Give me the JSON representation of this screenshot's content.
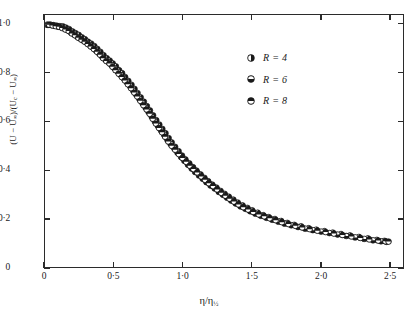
{
  "chart_data": {
    "type": "scatter",
    "title": "",
    "xlabel": "η/η½",
    "ylabel": "(U − U∞)/(Uᴄ − U∞)",
    "xlim": [
      0,
      2.6
    ],
    "ylim": [
      0,
      1.04
    ],
    "grid": false,
    "xticks": [
      0,
      0.5,
      1.0,
      1.5,
      2.0,
      2.5
    ],
    "xticklabels": [
      "0",
      "0·5",
      "1·0",
      "1·5",
      "2·0",
      "2·5"
    ],
    "yticks": [
      0,
      0.2,
      0.4,
      0.6,
      0.8,
      1.0
    ],
    "yticklabels": [
      "0",
      "0·2",
      "0·4",
      "0·6",
      "0·8",
      "1·0"
    ],
    "legend_position": "upper right",
    "marker_color": "#1a1a1a",
    "series": [
      {
        "name": "R = 4",
        "label": "R = 4",
        "marker": "circle-half-left",
        "points": [
          [
            0.015,
            1.0
          ],
          [
            0.04,
            1.0
          ],
          [
            0.062,
            0.998
          ],
          [
            0.085,
            0.996
          ],
          [
            0.108,
            0.994
          ],
          [
            0.13,
            0.993
          ],
          [
            0.152,
            0.988
          ],
          [
            0.175,
            0.982
          ],
          [
            0.2,
            0.972
          ],
          [
            0.222,
            0.965
          ],
          [
            0.245,
            0.958
          ],
          [
            0.268,
            0.948
          ],
          [
            0.29,
            0.94
          ],
          [
            0.312,
            0.93
          ],
          [
            0.335,
            0.922
          ],
          [
            0.358,
            0.912
          ],
          [
            0.38,
            0.9
          ],
          [
            0.402,
            0.888
          ],
          [
            0.425,
            0.874
          ],
          [
            0.448,
            0.862
          ],
          [
            0.47,
            0.852
          ],
          [
            0.492,
            0.84
          ],
          [
            0.515,
            0.828
          ],
          [
            0.538,
            0.812
          ],
          [
            0.56,
            0.8
          ],
          [
            0.582,
            0.784
          ],
          [
            0.605,
            0.768
          ],
          [
            0.628,
            0.752
          ],
          [
            0.65,
            0.735
          ],
          [
            0.672,
            0.718
          ],
          [
            0.695,
            0.7
          ],
          [
            0.718,
            0.682
          ],
          [
            0.74,
            0.664
          ],
          [
            0.762,
            0.646
          ],
          [
            0.785,
            0.626
          ],
          [
            0.808,
            0.606
          ],
          [
            0.83,
            0.588
          ],
          [
            0.852,
            0.57
          ],
          [
            0.875,
            0.552
          ],
          [
            0.898,
            0.532
          ],
          [
            0.92,
            0.514
          ],
          [
            0.945,
            0.496
          ],
          [
            0.97,
            0.478
          ],
          [
            0.995,
            0.46
          ],
          [
            1.02,
            0.444
          ],
          [
            1.048,
            0.428
          ],
          [
            1.075,
            0.412
          ],
          [
            1.1,
            0.398
          ],
          [
            1.13,
            0.382
          ],
          [
            1.158,
            0.368
          ],
          [
            1.185,
            0.354
          ],
          [
            1.215,
            0.34
          ],
          [
            1.245,
            0.328
          ],
          [
            1.275,
            0.314
          ],
          [
            1.305,
            0.302
          ],
          [
            1.335,
            0.29
          ],
          [
            1.368,
            0.278
          ],
          [
            1.4,
            0.266
          ],
          [
            1.435,
            0.254
          ],
          [
            1.47,
            0.244
          ],
          [
            1.505,
            0.234
          ],
          [
            1.545,
            0.224
          ],
          [
            1.585,
            0.214
          ],
          [
            1.625,
            0.206
          ],
          [
            1.67,
            0.198
          ],
          [
            1.715,
            0.19
          ],
          [
            1.76,
            0.182
          ],
          [
            1.81,
            0.174
          ],
          [
            1.86,
            0.168
          ],
          [
            1.915,
            0.16
          ],
          [
            1.97,
            0.154
          ],
          [
            2.03,
            0.148
          ],
          [
            2.09,
            0.142
          ],
          [
            2.15,
            0.136
          ],
          [
            2.215,
            0.13
          ],
          [
            2.28,
            0.124
          ],
          [
            2.345,
            0.118
          ],
          [
            2.41,
            0.112
          ],
          [
            2.465,
            0.108
          ]
        ]
      },
      {
        "name": "R = 6",
        "label": "R = 6",
        "marker": "circle-half-top",
        "points": [
          [
            0.022,
            0.999
          ],
          [
            0.048,
            0.998
          ],
          [
            0.072,
            0.995
          ],
          [
            0.095,
            0.992
          ],
          [
            0.118,
            0.99
          ],
          [
            0.142,
            0.984
          ],
          [
            0.165,
            0.978
          ],
          [
            0.188,
            0.968
          ],
          [
            0.212,
            0.96
          ],
          [
            0.235,
            0.95
          ],
          [
            0.258,
            0.942
          ],
          [
            0.28,
            0.934
          ],
          [
            0.302,
            0.926
          ],
          [
            0.325,
            0.916
          ],
          [
            0.348,
            0.906
          ],
          [
            0.37,
            0.894
          ],
          [
            0.392,
            0.882
          ],
          [
            0.415,
            0.868
          ],
          [
            0.438,
            0.856
          ],
          [
            0.46,
            0.846
          ],
          [
            0.482,
            0.834
          ],
          [
            0.505,
            0.82
          ],
          [
            0.528,
            0.806
          ],
          [
            0.55,
            0.792
          ],
          [
            0.572,
            0.778
          ],
          [
            0.595,
            0.762
          ],
          [
            0.618,
            0.746
          ],
          [
            0.64,
            0.728
          ],
          [
            0.662,
            0.712
          ],
          [
            0.685,
            0.694
          ],
          [
            0.708,
            0.676
          ],
          [
            0.73,
            0.658
          ],
          [
            0.752,
            0.64
          ],
          [
            0.775,
            0.62
          ],
          [
            0.798,
            0.6
          ],
          [
            0.82,
            0.582
          ],
          [
            0.842,
            0.564
          ],
          [
            0.865,
            0.546
          ],
          [
            0.888,
            0.526
          ],
          [
            0.912,
            0.508
          ],
          [
            0.938,
            0.49
          ],
          [
            0.962,
            0.472
          ],
          [
            0.988,
            0.454
          ],
          [
            1.012,
            0.438
          ],
          [
            1.038,
            0.422
          ],
          [
            1.065,
            0.406
          ],
          [
            1.09,
            0.392
          ],
          [
            1.118,
            0.378
          ],
          [
            1.145,
            0.364
          ],
          [
            1.172,
            0.35
          ],
          [
            1.202,
            0.336
          ],
          [
            1.232,
            0.324
          ],
          [
            1.262,
            0.31
          ],
          [
            1.292,
            0.298
          ],
          [
            1.322,
            0.286
          ],
          [
            1.352,
            0.274
          ],
          [
            1.385,
            0.262
          ],
          [
            1.42,
            0.25
          ],
          [
            1.455,
            0.24
          ],
          [
            1.49,
            0.23
          ],
          [
            1.528,
            0.22
          ],
          [
            1.568,
            0.211
          ],
          [
            1.608,
            0.203
          ],
          [
            1.65,
            0.195
          ],
          [
            1.695,
            0.187
          ],
          [
            1.74,
            0.179
          ],
          [
            1.788,
            0.172
          ],
          [
            1.838,
            0.165
          ],
          [
            1.89,
            0.158
          ],
          [
            1.945,
            0.152
          ],
          [
            2.005,
            0.146
          ],
          [
            2.065,
            0.14
          ],
          [
            2.125,
            0.134
          ],
          [
            2.188,
            0.128
          ],
          [
            2.252,
            0.122
          ],
          [
            2.318,
            0.116
          ],
          [
            2.382,
            0.11
          ],
          [
            2.44,
            0.106
          ],
          [
            2.48,
            0.104
          ]
        ]
      },
      {
        "name": "R = 8",
        "label": "R = 8",
        "marker": "circle-half-bottom",
        "points": [
          [
            0.03,
            1.0
          ],
          [
            0.055,
            0.997
          ],
          [
            0.078,
            0.994
          ],
          [
            0.102,
            0.991
          ],
          [
            0.125,
            0.986
          ],
          [
            0.148,
            0.98
          ],
          [
            0.172,
            0.974
          ],
          [
            0.195,
            0.964
          ],
          [
            0.218,
            0.956
          ],
          [
            0.242,
            0.946
          ],
          [
            0.265,
            0.938
          ],
          [
            0.288,
            0.93
          ],
          [
            0.31,
            0.92
          ],
          [
            0.332,
            0.91
          ],
          [
            0.355,
            0.9
          ],
          [
            0.378,
            0.888
          ],
          [
            0.4,
            0.876
          ],
          [
            0.422,
            0.862
          ],
          [
            0.445,
            0.85
          ],
          [
            0.468,
            0.84
          ],
          [
            0.49,
            0.826
          ],
          [
            0.512,
            0.812
          ],
          [
            0.535,
            0.798
          ],
          [
            0.558,
            0.784
          ],
          [
            0.58,
            0.77
          ],
          [
            0.602,
            0.754
          ],
          [
            0.625,
            0.738
          ],
          [
            0.648,
            0.72
          ],
          [
            0.67,
            0.704
          ],
          [
            0.692,
            0.686
          ],
          [
            0.715,
            0.668
          ],
          [
            0.738,
            0.65
          ],
          [
            0.76,
            0.632
          ],
          [
            0.782,
            0.612
          ],
          [
            0.805,
            0.592
          ],
          [
            0.828,
            0.574
          ],
          [
            0.85,
            0.556
          ],
          [
            0.872,
            0.538
          ],
          [
            0.895,
            0.518
          ],
          [
            0.92,
            0.5
          ],
          [
            0.945,
            0.484
          ],
          [
            0.972,
            0.466
          ],
          [
            0.998,
            0.45
          ],
          [
            1.025,
            0.434
          ],
          [
            1.052,
            0.418
          ],
          [
            1.078,
            0.404
          ],
          [
            1.105,
            0.39
          ],
          [
            1.135,
            0.374
          ],
          [
            1.162,
            0.36
          ],
          [
            1.19,
            0.346
          ],
          [
            1.22,
            0.334
          ],
          [
            1.25,
            0.32
          ],
          [
            1.28,
            0.306
          ],
          [
            1.31,
            0.294
          ],
          [
            1.34,
            0.282
          ],
          [
            1.372,
            0.27
          ],
          [
            1.405,
            0.258
          ],
          [
            1.44,
            0.247
          ],
          [
            1.475,
            0.237
          ],
          [
            1.512,
            0.227
          ],
          [
            1.552,
            0.217
          ],
          [
            1.592,
            0.209
          ],
          [
            1.632,
            0.201
          ],
          [
            1.675,
            0.193
          ],
          [
            1.72,
            0.185
          ],
          [
            1.768,
            0.177
          ],
          [
            1.818,
            0.17
          ],
          [
            1.868,
            0.163
          ],
          [
            1.922,
            0.156
          ],
          [
            1.978,
            0.15
          ],
          [
            2.038,
            0.144
          ],
          [
            2.098,
            0.138
          ],
          [
            2.16,
            0.132
          ],
          [
            2.225,
            0.126
          ],
          [
            2.29,
            0.12
          ],
          [
            2.355,
            0.114
          ],
          [
            2.42,
            0.109
          ],
          [
            2.472,
            0.106
          ],
          [
            2.495,
            0.105
          ]
        ]
      }
    ]
  },
  "axes": {
    "y_title_html": "(U &minus; U<sub>&infin;</sub>)/(U<sub>c</sub> &minus; U<sub>&infin;</sub>)",
    "x_title_html": "&eta;/&eta;<sub>&frac12;</sub>"
  },
  "legend": {
    "entries": [
      {
        "label": "R = 4",
        "marker": "circle-half-left"
      },
      {
        "label": "R = 6",
        "marker": "circle-half-top"
      },
      {
        "label": "R = 8",
        "marker": "circle-half-bottom"
      }
    ]
  }
}
